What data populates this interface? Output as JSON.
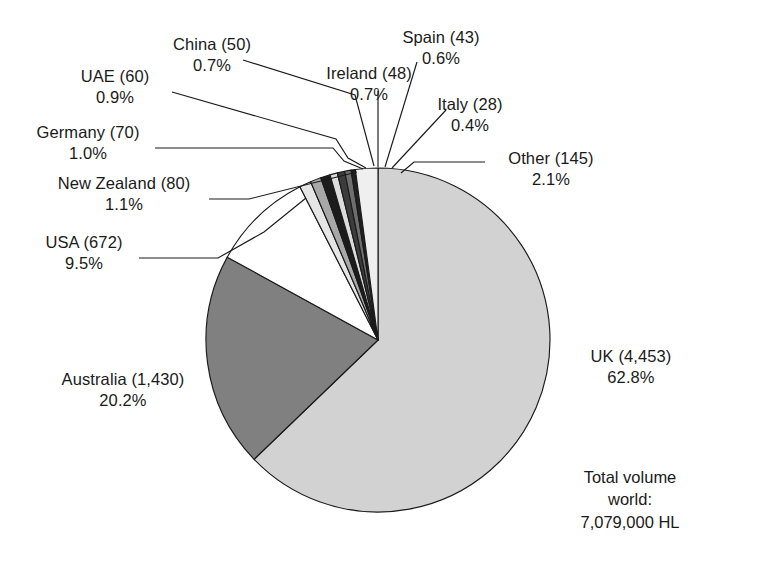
{
  "chart_data": {
    "type": "pie",
    "title": "",
    "subtitle": "",
    "xlabel": "",
    "ylabel": "",
    "legend_position": "callout-labels",
    "grid": false,
    "start_angle_deg": 0,
    "direction": "clockwise",
    "units": "thousand HL",
    "categories": [
      "UK",
      "Australia",
      "USA",
      "Other",
      "New Zealand",
      "Germany",
      "UAE",
      "China",
      "Ireland",
      "Spain",
      "Italy"
    ],
    "values": [
      4453,
      1430,
      672,
      145,
      80,
      70,
      60,
      50,
      48,
      43,
      28
    ],
    "percentages": [
      62.8,
      20.2,
      9.5,
      2.1,
      1.1,
      1.0,
      0.9,
      0.7,
      0.7,
      0.6,
      0.4
    ],
    "slices": [
      {
        "key": "uk",
        "label": "UK",
        "value_text": "4,453",
        "value": 4453,
        "percent_text": "62.8%",
        "percent": 62.8,
        "color": "#d2d2d2"
      },
      {
        "key": "australia",
        "label": "Australia",
        "value_text": "1,430",
        "value": 1430,
        "percent_text": "20.2%",
        "percent": 20.2,
        "color": "#808080"
      },
      {
        "key": "usa",
        "label": "USA",
        "value_text": "672",
        "value": 672,
        "percent_text": "9.5%",
        "percent": 9.5,
        "color": "#ffffff"
      },
      {
        "key": "new-zealand",
        "label": "New Zealand",
        "value_text": "80",
        "value": 80,
        "percent_text": "1.1%",
        "percent": 1.1,
        "color": "#e6e6e6"
      },
      {
        "key": "germany",
        "label": "Germany",
        "value_text": "70",
        "value": 70,
        "percent_text": "1.0%",
        "percent": 1.0,
        "color": "#a8a8a8"
      },
      {
        "key": "uae",
        "label": "UAE",
        "value_text": "60",
        "value": 60,
        "percent_text": "0.9%",
        "percent": 0.9,
        "color": "#1c1c1c"
      },
      {
        "key": "china",
        "label": "China",
        "value_text": "50",
        "value": 50,
        "percent_text": "0.7%",
        "percent": 0.7,
        "color": "#dcdcdc"
      },
      {
        "key": "ireland",
        "label": "Ireland",
        "value_text": "48",
        "value": 48,
        "percent_text": "0.7%",
        "percent": 0.7,
        "color": "#3c3c3c"
      },
      {
        "key": "spain",
        "label": "Spain",
        "value_text": "43",
        "value": 43,
        "percent_text": "0.6%",
        "percent": 0.6,
        "color": "#6e6e6e"
      },
      {
        "key": "italy",
        "label": "Italy",
        "value_text": "28",
        "value": 28,
        "percent_text": "0.4%",
        "percent": 0.4,
        "color": "#202020"
      },
      {
        "key": "other",
        "label": "Other",
        "value_text": "145",
        "value": 145,
        "percent_text": "2.1%",
        "percent": 2.1,
        "color": "#efefef"
      }
    ],
    "total": {
      "line1": "Total volume",
      "line2": "world:",
      "line3": "7,079,000 HL",
      "value": 7079000,
      "unit": "HL"
    }
  },
  "callouts": {
    "china": {
      "l1": "China (50)",
      "l2": "0.7%"
    },
    "uae": {
      "l1": "UAE (60)",
      "l2": "0.9%"
    },
    "germany": {
      "l1": "Germany (70)",
      "l2": "1.0%"
    },
    "new_zealand": {
      "l1": "New Zealand (80)",
      "l2": "1.1%"
    },
    "usa": {
      "l1": "USA (672)",
      "l2": "9.5%"
    },
    "australia": {
      "l1": "Australia (1,430)",
      "l2": "20.2%"
    },
    "spain": {
      "l1": "Spain (43)",
      "l2": "0.6%"
    },
    "ireland": {
      "l1": "Ireland (48)",
      "l2": "0.7%"
    },
    "italy": {
      "l1": "Italy (28)",
      "l2": "0.4%"
    },
    "other": {
      "l1": "Other (145)",
      "l2": "2.1%"
    },
    "uk": {
      "l1": "UK (4,453)",
      "l2": "62.8%"
    }
  }
}
